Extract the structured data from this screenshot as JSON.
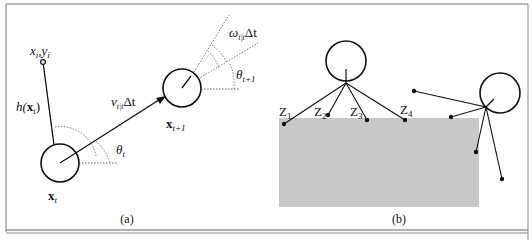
{
  "figure": {
    "panel_a": {
      "caption": "(a)",
      "landmark_label": "x",
      "landmark_label_sub": "i",
      "landmark_label_sep": ",",
      "landmark_label_y": "y",
      "landmark_label_y_sub": "i",
      "measurement_label": "h(",
      "measurement_label_x": "x",
      "measurement_label_sub": "t",
      "measurement_label_close": ")",
      "velocity_label_v": "v",
      "velocity_label_sub": "t|t",
      "velocity_label_delta": "Δt",
      "omega_label_w": "ω",
      "omega_label_sub": "t|t",
      "omega_label_delta": "Δt",
      "theta_t_label": "θ",
      "theta_t_sub": "t",
      "theta_t1_label": "θ",
      "theta_t1_sub": "t+1",
      "pose_t_label": "x",
      "pose_t_sub": "t",
      "pose_t1_label": "x",
      "pose_t1_sub": "t+1"
    },
    "panel_b": {
      "caption": "(b)",
      "z_labels": [
        {
          "main": "Z",
          "sub": "1"
        },
        {
          "main": "Z",
          "sub": "2"
        },
        {
          "main": "Z",
          "sub": "3"
        },
        {
          "main": "Z",
          "sub": "4"
        }
      ],
      "obstacle_color": "#c8c8c8"
    },
    "colors": {
      "ink": "#111111",
      "dotted": "#555555",
      "frame": "#666666"
    }
  }
}
